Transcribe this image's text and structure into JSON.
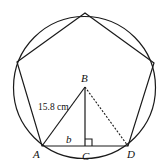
{
  "diagram": {
    "labels": {
      "A": "A",
      "B": "B",
      "C": "C",
      "D": "D",
      "side_b": "b",
      "hypotenuse": "15.8 cm"
    },
    "colors": {
      "stroke": "#1a1a1a",
      "background": "#ffffff"
    }
  }
}
